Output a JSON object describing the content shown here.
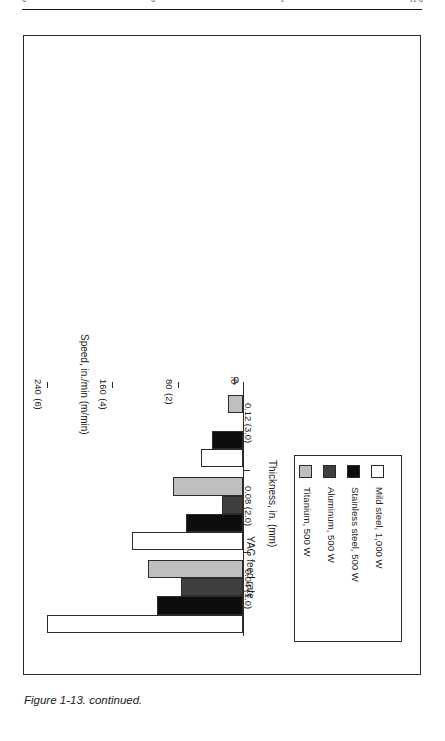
{
  "page_header": {
    "left_fragment": "0",
    "mid_fragment": "0",
    "right_fragment": "1",
    "far_right_fragment": "0.11"
  },
  "figure": {
    "caption": "Figure 1-13. continued.",
    "subfigure_label": "d."
  },
  "legend": {
    "entries": [
      {
        "label": "Mild steel, 1,000 W",
        "color": "#ffffff"
      },
      {
        "label": "Stainless steel, 500 W",
        "color": "#0d0d0d"
      },
      {
        "label": "Aluminum, 500 W",
        "color": "#3f3f3f"
      },
      {
        "label": "Titanium, 500 W",
        "color": "#bfbfbf"
      }
    ]
  },
  "chart_data": {
    "type": "bar",
    "title": "YAG feed rate",
    "xlabel": "Thickness, in. (mm)",
    "ylabel": "Speed, in./min (m/min)",
    "categories": [
      "0.04 (1.0)",
      "0.08 (2.0)",
      "0.12 (3.0)"
    ],
    "ylim": [
      0,
      240
    ],
    "yticks": [
      0,
      80,
      160,
      240
    ],
    "ytick_labels": [
      "0",
      "80\n(2)",
      "160\n(4)",
      "240\n(6)"
    ],
    "ytick_label_main": [
      "0",
      "80",
      "160",
      "240"
    ],
    "ytick_label_paren": [
      "",
      "(2)",
      "(4)",
      "(6)"
    ],
    "grid": false,
    "legend_position": "right",
    "orientation": "horizontal",
    "series": [
      {
        "name": "Mild steel, 1,000 W",
        "color": "#ffffff",
        "values": [
          240,
          136,
          52
        ]
      },
      {
        "name": "Stainless steel, 500 W",
        "color": "#0d0d0d",
        "values": [
          105,
          70,
          38
        ]
      },
      {
        "name": "Aluminum, 500 W",
        "color": "#3f3f3f",
        "values": [
          76,
          26,
          0
        ]
      },
      {
        "name": "Titanium, 500 W",
        "color": "#bfbfbf",
        "values": [
          116,
          86,
          18
        ]
      }
    ]
  }
}
